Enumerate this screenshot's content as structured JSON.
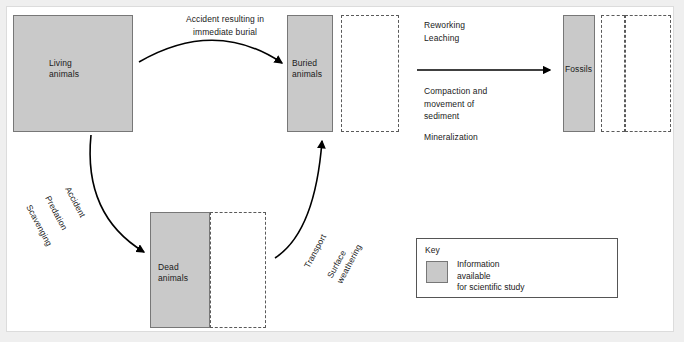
{
  "diagram": {
    "colors": {
      "available_fill": "#c9c9c9",
      "box_stroke": "#777777",
      "dashed_stroke": "#5a5a5a",
      "arrow": "#000000",
      "page_background": "#efefef",
      "canvas_background": "#ffffff"
    },
    "nodes": [
      {
        "id": "living",
        "label": "Living\nanimals"
      },
      {
        "id": "buried",
        "label": "Buried\nanimals"
      },
      {
        "id": "dead",
        "label": "Dead\nanimals"
      },
      {
        "id": "fossils",
        "label": "Fossils"
      }
    ],
    "edge_labels": {
      "burial": "Accident resulting in\nimmediate burial",
      "death_1": "Accident",
      "death_2": "Predation",
      "death_3": "Scavenging",
      "exposure_1": "Transport",
      "exposure_2": "Surface\nweathering",
      "diagenesis_1": "Reworking\nLeaching",
      "diagenesis_2": "Compaction and\nmovement of\nsediment",
      "diagenesis_3": "Mineralization"
    },
    "key": {
      "title": "Key",
      "swatch_label": "Information\navailable\nfor scientific study"
    }
  }
}
